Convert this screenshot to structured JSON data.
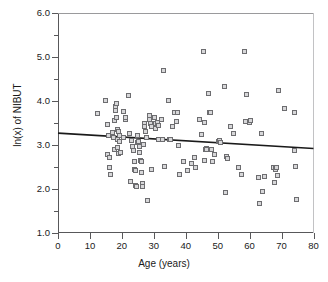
{
  "chart_data": {
    "type": "scatter",
    "title": "",
    "xlabel": "Age (years)",
    "ylabel": "ln(x) of NIBUT",
    "xlim": [
      0,
      80
    ],
    "ylim": [
      1.0,
      6.0
    ],
    "xticks": [
      0,
      10,
      20,
      30,
      40,
      50,
      60,
      70,
      80
    ],
    "xtick_labels": [
      "0",
      "10",
      "20",
      "30",
      "40",
      "50",
      "60",
      "70",
      "80"
    ],
    "yticks": [
      1.0,
      2.0,
      3.0,
      4.0,
      5.0,
      6.0
    ],
    "ytick_labels": [
      "1.0",
      "2.0",
      "3.0",
      "4.0",
      "5.0",
      "6.0"
    ],
    "yminor_ticks": [
      1.5,
      2.5,
      3.5,
      4.5,
      5.5
    ],
    "grid": false,
    "legend": null,
    "marker": {
      "shape": "square",
      "size_px": 5,
      "fill_color": "#d7d7d9",
      "edge_color": "#6d6d70"
    },
    "series": [
      {
        "name": "NIBUT observations",
        "points": [
          [
            12.5,
            3.72
          ],
          [
            14.8,
            4.01
          ],
          [
            15.4,
            3.46
          ],
          [
            15.6,
            2.78
          ],
          [
            15.8,
            3.21
          ],
          [
            16.0,
            2.72
          ],
          [
            16.2,
            2.48
          ],
          [
            16.4,
            2.33
          ],
          [
            17.2,
            3.29
          ],
          [
            17.4,
            3.18
          ],
          [
            17.6,
            2.9
          ],
          [
            17.8,
            3.55
          ],
          [
            18.0,
            3.79
          ],
          [
            18.1,
            3.88
          ],
          [
            18.2,
            3.95
          ],
          [
            18.3,
            3.62
          ],
          [
            18.5,
            3.36
          ],
          [
            18.6,
            3.12
          ],
          [
            18.7,
            2.95
          ],
          [
            18.8,
            2.8
          ],
          [
            19.0,
            3.3
          ],
          [
            19.2,
            3.22
          ],
          [
            19.4,
            3.08
          ],
          [
            19.6,
            2.84
          ],
          [
            20.4,
            3.76
          ],
          [
            20.6,
            3.18
          ],
          [
            21.0,
            3.58
          ],
          [
            21.2,
            3.63
          ],
          [
            22.2,
            4.12
          ],
          [
            22.4,
            3.26
          ],
          [
            22.6,
            2.18
          ],
          [
            23.0,
            3.1
          ],
          [
            23.4,
            2.96
          ],
          [
            23.6,
            2.88
          ],
          [
            23.8,
            2.62
          ],
          [
            24.0,
            2.45
          ],
          [
            24.2,
            2.43
          ],
          [
            24.4,
            2.08
          ],
          [
            24.6,
            2.05
          ],
          [
            24.8,
            3.05
          ],
          [
            25.0,
            3.22
          ],
          [
            25.2,
            3.08
          ],
          [
            25.4,
            2.97
          ],
          [
            25.6,
            2.82
          ],
          [
            25.8,
            2.65
          ],
          [
            26.0,
            2.62
          ],
          [
            26.2,
            2.38
          ],
          [
            26.4,
            2.12
          ],
          [
            26.6,
            2.06
          ],
          [
            26.8,
            3.02
          ],
          [
            27.0,
            3.5
          ],
          [
            27.2,
            3.43
          ],
          [
            27.4,
            3.3
          ],
          [
            27.6,
            3.18
          ],
          [
            28.0,
            1.74
          ],
          [
            28.6,
            3.66
          ],
          [
            28.8,
            3.58
          ],
          [
            29.0,
            3.48
          ],
          [
            29.2,
            3.42
          ],
          [
            29.4,
            2.44
          ],
          [
            30.2,
            3.62
          ],
          [
            30.4,
            3.5
          ],
          [
            30.6,
            3.38
          ],
          [
            31.0,
            3.52
          ],
          [
            31.4,
            3.44
          ],
          [
            31.6,
            3.12
          ],
          [
            32.4,
            3.58
          ],
          [
            32.6,
            3.13
          ],
          [
            33.0,
            4.7
          ],
          [
            33.2,
            2.52
          ],
          [
            34.6,
            4.02
          ],
          [
            35.0,
            3.12
          ],
          [
            35.2,
            3.13
          ],
          [
            36.0,
            3.42
          ],
          [
            36.4,
            3.74
          ],
          [
            37.0,
            3.54
          ],
          [
            37.4,
            3.74
          ],
          [
            37.6,
            2.98
          ],
          [
            38.0,
            2.34
          ],
          [
            39.4,
            2.62
          ],
          [
            40.6,
            2.42
          ],
          [
            41.8,
            2.58
          ],
          [
            42.6,
            2.72
          ],
          [
            43.0,
            2.48
          ],
          [
            44.4,
            3.58
          ],
          [
            44.8,
            3.24
          ],
          [
            45.6,
            5.12
          ],
          [
            45.8,
            3.52
          ],
          [
            46.0,
            2.64
          ],
          [
            46.2,
            2.9
          ],
          [
            46.4,
            2.92
          ],
          [
            46.6,
            2.9
          ],
          [
            47.0,
            4.16
          ],
          [
            47.4,
            3.74
          ],
          [
            47.6,
            3.73
          ],
          [
            48.0,
            2.9
          ],
          [
            48.4,
            2.62
          ],
          [
            49.0,
            2.78
          ],
          [
            50.2,
            3.08
          ],
          [
            50.6,
            3.1
          ],
          [
            51.0,
            3.06
          ],
          [
            52.0,
            4.32
          ],
          [
            52.4,
            1.92
          ],
          [
            52.8,
            2.74
          ],
          [
            53.2,
            2.7
          ],
          [
            54.0,
            3.42
          ],
          [
            55.0,
            3.26
          ],
          [
            56.6,
            2.5
          ],
          [
            57.6,
            2.34
          ],
          [
            58.4,
            5.13
          ],
          [
            58.8,
            3.54
          ],
          [
            59.0,
            4.15
          ],
          [
            60.0,
            3.52
          ],
          [
            60.4,
            3.56
          ],
          [
            62.8,
            2.26
          ],
          [
            63.2,
            1.66
          ],
          [
            63.6,
            3.26
          ],
          [
            64.0,
            1.94
          ],
          [
            64.6,
            2.28
          ],
          [
            67.4,
            2.48
          ],
          [
            67.8,
            2.14
          ],
          [
            68.0,
            2.46
          ],
          [
            68.2,
            2.44
          ],
          [
            68.4,
            2.5
          ],
          [
            68.6,
            2.3
          ],
          [
            69.0,
            4.24
          ],
          [
            71.0,
            3.82
          ],
          [
            74.0,
            3.74
          ],
          [
            74.2,
            2.88
          ],
          [
            74.4,
            2.52
          ],
          [
            74.6,
            1.76
          ]
        ]
      }
    ],
    "regression_line": {
      "x_start": 0,
      "y_start": 3.27,
      "x_end": 80,
      "y_end": 2.92,
      "color": "#1a1a1a",
      "width_px": 1.6
    }
  }
}
